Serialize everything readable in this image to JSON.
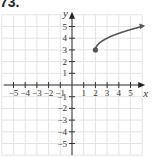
{
  "problem_label": "73.",
  "chart_data": {
    "type": "line",
    "title": "",
    "xlabel": "x",
    "ylabel": "y",
    "xlim": [
      -6,
      6
    ],
    "ylim": [
      -6,
      6
    ],
    "grid": true,
    "x_ticks": [
      "-5",
      "-4",
      "-3",
      "-2",
      "-1",
      "1",
      "2",
      "3",
      "4",
      "5"
    ],
    "y_ticks": [
      "5",
      "4",
      "3",
      "2",
      "1",
      "-1",
      "-2",
      "-3",
      "-4",
      "-5"
    ],
    "series": [
      {
        "name": "f(x) = sqrt(x - 2) + 3",
        "start_point": [
          2,
          3
        ],
        "start_point_style": "closed",
        "x": [
          2,
          2.25,
          3,
          4,
          5,
          6
        ],
        "y": [
          3,
          3.5,
          4,
          4.41,
          4.73,
          5
        ],
        "end_arrow": true,
        "color": "#555555"
      }
    ]
  }
}
